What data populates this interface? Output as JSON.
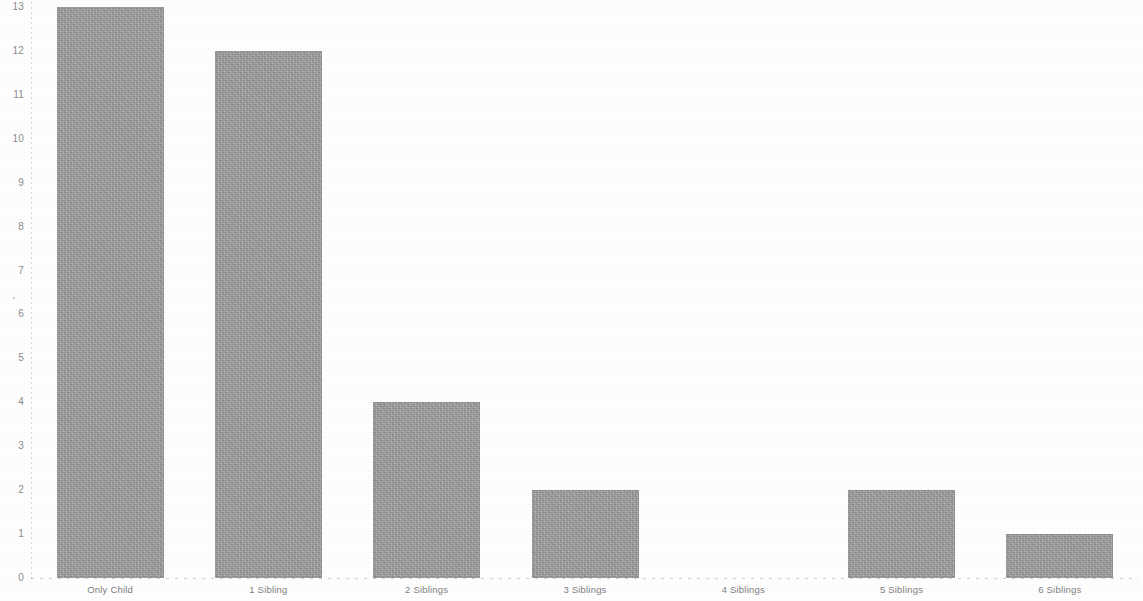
{
  "chart_data": {
    "type": "bar",
    "title": "",
    "subtitle": "",
    "xlabel": "",
    "ylabel": "",
    "categories": [
      "Only Child",
      "1 Sibling",
      "2 Siblings",
      "3 Siblings",
      "4 Siblings",
      "5 Siblings",
      "6 Siblings"
    ],
    "values": [
      13,
      12,
      4,
      2,
      0,
      2,
      1
    ],
    "ylim": [
      0,
      13
    ],
    "y_ticks": [
      0,
      1,
      2,
      3,
      4,
      5,
      6,
      7,
      8,
      9,
      10,
      11,
      12,
      13
    ],
    "y_tick_labels": [
      "0",
      "1",
      "2",
      "3",
      "4",
      "5",
      "6",
      "7",
      "8",
      "9",
      "10",
      "11",
      "12",
      "13"
    ],
    "grid": false,
    "legend": null,
    "legend_position": "none",
    "annotations": [],
    "bar_color": "#9c9c9c",
    "background_color": "#ffffff",
    "axis_color": "#8c8c8c",
    "tick_label_color": "#8c8c8c"
  },
  "figure": {
    "width": 1143,
    "height": 601
  }
}
